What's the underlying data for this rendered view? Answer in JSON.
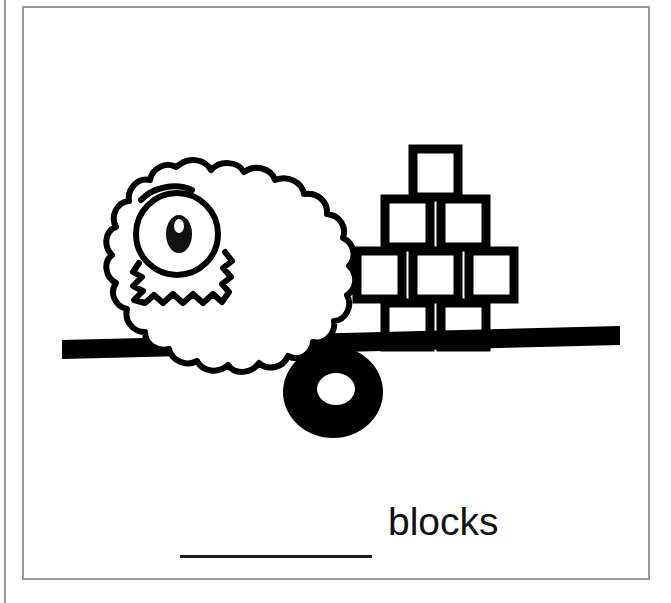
{
  "worksheet": {
    "frame": {
      "border_color": "#9a9a9a",
      "background": "#ffffff"
    },
    "illustration": {
      "name": "balance-scale-illustration",
      "description": "A balance scale beam resting on a round fulcrum. A fluffy one-eyed monster sits on the left end, which is tipped down; a pyramid stack of blocks sits on the right end, which is tipped up.",
      "ink_color": "#000000",
      "paper_color": "#ffffff",
      "left_object": {
        "name": "fluffy-monster",
        "label": "monster",
        "eyes": 1,
        "features": [
          "cloud-shaped fluffy body",
          "single large eye",
          "eyebrow",
          "zigzag jagged mouth"
        ]
      },
      "right_object": {
        "name": "block-stack",
        "label": "blocks",
        "total_blocks": 8,
        "rows": [
          {
            "row": 1,
            "count": 1
          },
          {
            "row": 2,
            "count": 2
          },
          {
            "row": 3,
            "count": 3
          },
          {
            "row": 4,
            "count": 2
          }
        ]
      },
      "fulcrum": {
        "name": "fulcrum-pivot",
        "shape": "donut"
      },
      "beam": {
        "name": "balance-beam",
        "tilt": "left side down"
      }
    },
    "answer": {
      "unit_label": "blocks",
      "blank_value": "",
      "blank_placeholder": ""
    }
  }
}
